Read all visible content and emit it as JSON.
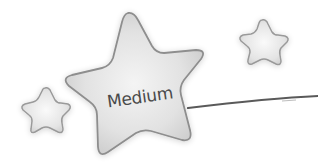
{
  "main_star": {
    "label": "Medium"
  },
  "colors": {
    "background": "#ffffff",
    "star_fill_edge": "#cfcfcf",
    "star_fill_center": "#f2f2f2",
    "star_stroke": "#8e8e8e",
    "line": "#5a5a5a",
    "text": "#4a4a4a"
  }
}
